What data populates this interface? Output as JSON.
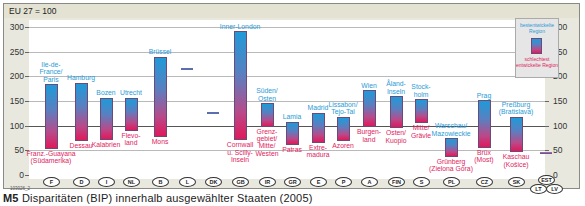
{
  "header": {
    "unit_label": "EU 27 = 100"
  },
  "caption": {
    "id": "M5",
    "text": "Disparitäten (BIP) innerhalb ausgewählter Staaten (2005)"
  },
  "code": "103026_2",
  "legend": {
    "top_label": "bestentwickelte Region",
    "bottom_label": "schlechtest entwickelte Region",
    "colors": {
      "top": "#1f9ad8",
      "bottom": "#e0195a"
    }
  },
  "axis": {
    "ticks": [
      "300",
      "250",
      "200",
      "150",
      "100",
      "50",
      "0"
    ]
  },
  "chart_data": {
    "type": "bar",
    "title": "Disparitäten (BIP) innerhalb ausgewählter Staaten (2005)",
    "subtitle": "EU 27 = 100",
    "xlabel": "",
    "ylabel": "BIP je Einwohner (EU 27 = 100)",
    "ylim": [
      0,
      300
    ],
    "yticks": [
      0,
      50,
      100,
      150,
      200,
      250,
      300
    ],
    "grid": true,
    "reference_line": 100,
    "legend_position": "top-right",
    "categories": [
      "F",
      "D",
      "I",
      "NL",
      "B",
      "L",
      "DK",
      "GB",
      "IR",
      "GR",
      "E",
      "P",
      "A",
      "FIN",
      "S",
      "PL",
      "CZ",
      "SK",
      "EST/LT/LV"
    ],
    "series": [
      {
        "name": "bestentwickelte Region",
        "values": [
          184,
          187,
          157,
          157,
          240,
          217,
          128,
          292,
          146,
          108,
          126,
          118,
          172,
          160,
          154,
          75,
          152,
          118,
          46
        ]
      },
      {
        "name": "schlechtest entwickelte Region",
        "values": [
          53,
          69,
          71,
          90,
          78,
          217,
          128,
          70,
          98,
          61,
          65,
          69,
          97,
          95,
          105,
          37,
          55,
          46,
          46
        ]
      }
    ],
    "region_labels": [
      {
        "country": "F",
        "best": "Ile-de-France/Paris",
        "worst": "Franz.-Guayana (Südamerika)"
      },
      {
        "country": "D",
        "best": "Hamburg",
        "worst": "Dessau"
      },
      {
        "country": "I",
        "best": "Bozen",
        "worst": "Kalabrien"
      },
      {
        "country": "NL",
        "best": "Utrecht",
        "worst": "Flevoland"
      },
      {
        "country": "B",
        "best": "Brüssel",
        "worst": "Mons"
      },
      {
        "country": "L",
        "best": "",
        "worst": ""
      },
      {
        "country": "DK",
        "best": "",
        "worst": ""
      },
      {
        "country": "GB",
        "best": "Inner-London",
        "worst": "Cornwall u. Scilly-Inseln"
      },
      {
        "country": "IR",
        "best": "Süden/Osten",
        "worst": "Grenzgebiet/Mitte/Westen"
      },
      {
        "country": "GR",
        "best": "Lamia",
        "worst": "Patras"
      },
      {
        "country": "E",
        "best": "Madrid",
        "worst": "Extremadura"
      },
      {
        "country": "P",
        "best": "Lissabon/Tejo-Tal",
        "worst": "Azoren"
      },
      {
        "country": "A",
        "best": "Wien",
        "worst": "Burgenland"
      },
      {
        "country": "FIN",
        "best": "Åland-Inseln",
        "worst": "Osten/Kuopio"
      },
      {
        "country": "S",
        "best": "Stockholm",
        "worst": "Mitte/Grävle"
      },
      {
        "country": "PL",
        "best": "Warschau/Mazowieckie",
        "worst": "Grünberg (Zielona Góra)"
      },
      {
        "country": "CZ",
        "best": "Prag",
        "worst": "Brüx (Most)"
      },
      {
        "country": "SK",
        "best": "Preßburg (Bratislava)",
        "worst": "Kaschau (Košice)"
      },
      {
        "country": "EST/LT/LV",
        "best": "",
        "worst": ""
      }
    ]
  },
  "labels": {
    "F_top": [
      "Ile-de-",
      "France/",
      "Paris"
    ],
    "F_bot": [
      "Franz.-Guayana",
      "(Südamerika)"
    ],
    "D_top": [
      "Hamburg"
    ],
    "D_bot": [
      "Dessau"
    ],
    "I_top": [
      "Bozen"
    ],
    "I_bot": [
      "Kalabrien"
    ],
    "NL_top": [
      "Utrecht"
    ],
    "NL_bot": [
      "Flevo-",
      "land"
    ],
    "B_top": [
      "Brüssel"
    ],
    "B_bot": [
      "Mons"
    ],
    "GB_top": [
      "Inner-London"
    ],
    "GB_bot": [
      "Cornwall",
      "u. Scilly-",
      "Inseln"
    ],
    "IR_top": [
      "Süden/",
      "Osten"
    ],
    "IR_bot": [
      "Grenz-",
      "gebiet/",
      "Mitte/",
      "Westen"
    ],
    "GR_top": [
      "Lamia"
    ],
    "GR_bot": [
      "Patras"
    ],
    "E_top": [
      "Madrid"
    ],
    "E_bot": [
      "Extre-",
      "madura"
    ],
    "P_top": [
      "Lissabon/",
      "Tejo-Tal"
    ],
    "P_bot": [
      "Azoren"
    ],
    "A_top": [
      "Wien"
    ],
    "A_bot": [
      "Burgen-",
      "land"
    ],
    "FIN_top": [
      "Åland-",
      "Inseln"
    ],
    "FIN_bot": [
      "Osten/",
      "Kuopio"
    ],
    "S_top": [
      "Stock-",
      "holm"
    ],
    "S_bot": [
      "Mitte/",
      "Grävle"
    ],
    "PL_top": [
      "Warschau/",
      "Mazowieckie"
    ],
    "PL_bot": [
      "Grünberg",
      "(Zielona Góra)"
    ],
    "CZ_top": [
      "Prag"
    ],
    "CZ_bot": [
      "Brüx",
      "(Most)"
    ],
    "SK_top": [
      "Preßburg",
      "(Bratislava)"
    ],
    "SK_bot": [
      "Kaschau",
      "(Košice)"
    ]
  },
  "countries": [
    "F",
    "D",
    "I",
    "NL",
    "B",
    "L",
    "DK",
    "GB",
    "IR",
    "GR",
    "E",
    "P",
    "A",
    "FIN",
    "S",
    "PL",
    "CZ",
    "SK",
    "EST",
    "LT",
    "LV"
  ]
}
